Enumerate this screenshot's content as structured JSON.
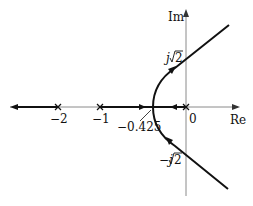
{
  "diagram": {
    "type": "root-locus",
    "axes": {
      "x_label": "Re",
      "y_label": "Im"
    },
    "tick_labels": {
      "minus_two": "−2",
      "minus_one": "−1",
      "zero": "0"
    },
    "annotations": {
      "breakaway": "−0.425",
      "upper_crossing_j": "j",
      "upper_crossing_val": "2",
      "lower_crossing_j": "−j",
      "lower_crossing_val": "2"
    },
    "poles": [
      0,
      -1,
      -2
    ],
    "breakaway_point": -0.425,
    "imag_axis_crossings": [
      "j√2",
      "-j√2"
    ],
    "colors": {
      "locus": "#111111",
      "axis": "#777777"
    }
  }
}
